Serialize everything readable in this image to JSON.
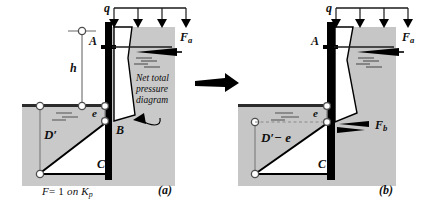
{
  "figure": {
    "title_tags": {
      "panel_a": "(a)",
      "panel_b": "(b)"
    },
    "colors": {
      "soil_fill": "#c9c9c9",
      "soil_fill_b": "#c6c6c6",
      "wall_black": "#000000",
      "white_fill": "#ffffff",
      "line": "#000000",
      "dim_line": "#8a8a8a",
      "pressure_shade": "#bdbdbd"
    }
  },
  "panel_a": {
    "label": "(a)",
    "surcharge_label": "q",
    "point_a": "A",
    "point_b": "B",
    "point_c": "C",
    "force_active": "F",
    "force_active_sub": "a",
    "dim_h": "h",
    "dim_e": "e",
    "dim_d": "D",
    "dim_d_prime": "′",
    "annotation": [
      "Net total",
      "pressure",
      "diagram"
    ],
    "equation_parts": {
      "f": "F",
      "eq": "= 1",
      "on": "on",
      "k": "K",
      "k_sub": "p"
    },
    "equation_full": "F = 1  on  Kₚ"
  },
  "panel_b": {
    "label": "(b)",
    "surcharge_label": "q",
    "point_a": "A",
    "point_c": "C",
    "force_active": "F",
    "force_active_sub": "a",
    "force_balance": "F",
    "force_balance_sub": "b",
    "dim_e": "e",
    "dim_d_minus_e": "D′ − e",
    "dim_d": "D",
    "dim_d_prime": "′",
    "dim_minus_e": "− e"
  },
  "transition": {
    "arrow": "transition-arrow"
  }
}
